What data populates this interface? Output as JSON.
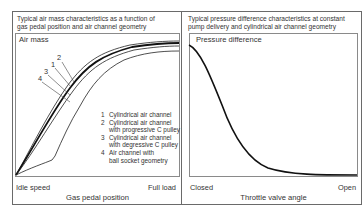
{
  "figure": {
    "left_panel": {
      "title_line1": "Typical air mass characteristics as a function of",
      "title_line2": "gas pedal position and air channel geometry",
      "y_axis_label": "Air mass",
      "x_tick_left": "Idle speed",
      "x_tick_right": "Full load",
      "x_axis_label": "Gas pedal position",
      "curve_callouts": [
        "2",
        "1",
        "3",
        "4"
      ],
      "legend": [
        {
          "num": "1",
          "line1": "Cylindrical air channel",
          "line2": ""
        },
        {
          "num": "2",
          "line1": "Cylindrical air channel",
          "line2": "with progressive C pulley"
        },
        {
          "num": "3",
          "line1": "Cylindrical air channel",
          "line2": "with degressive C pulley"
        },
        {
          "num": "4",
          "line1": "Air channel with",
          "line2": "ball socket geometry"
        }
      ]
    },
    "right_panel": {
      "title_line1": "Typical pressure difference characteristics at constant",
      "title_line2": "pump delivery and cylindrical air channel geometry",
      "y_axis_label": "Pressure difference",
      "x_tick_left": "Closed",
      "x_tick_right": "Open",
      "x_axis_label": "Throttle valve angle"
    },
    "colors": {
      "frame": "#6a6a6a",
      "plot_border": "#8a8a8a",
      "curve": "#111111",
      "text": "#333333"
    }
  }
}
